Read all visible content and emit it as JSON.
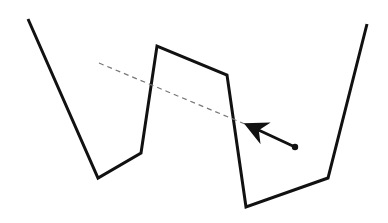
{
  "diagram": {
    "width": 388,
    "height": 223,
    "background": "#ffffff",
    "boundary": {
      "stroke": "#111111",
      "stroke_width": 3,
      "points": [
        [
          28,
          19
        ],
        [
          98,
          178
        ],
        [
          141,
          153
        ],
        [
          157,
          46
        ],
        [
          227,
          75
        ],
        [
          246,
          207
        ],
        [
          328,
          178
        ],
        [
          367,
          24
        ]
      ]
    },
    "dashed_line": {
      "stroke": "#777777",
      "stroke_width": 1.2,
      "dash": "5,4",
      "from": [
        99,
        63
      ],
      "to": [
        252,
        127
      ]
    },
    "arrow": {
      "stroke": "#111111",
      "stroke_width": 3,
      "from": [
        295,
        147
      ],
      "to": [
        252,
        127
      ],
      "dot_radius": 3.2
    }
  }
}
